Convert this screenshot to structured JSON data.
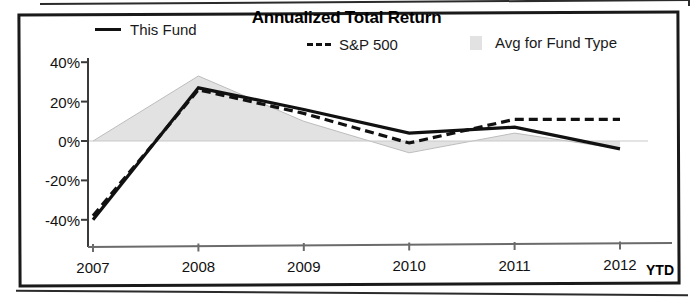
{
  "chart": {
    "title": "Annualized Total Return",
    "legend": [
      {
        "label": "This Fund",
        "marker": "solid-line-swatch"
      },
      {
        "label": "S&P 500",
        "marker": "dashed-line-swatch"
      },
      {
        "label": "Avg for Fund Type",
        "marker": "area-fill-swatch"
      }
    ],
    "ytd_suffix": "YTD"
  },
  "chart_data": {
    "type": "line",
    "title": "Annualized Total Return",
    "xlabel": "",
    "ylabel": "",
    "categories": [
      "2007",
      "2008",
      "2009",
      "2010",
      "2011",
      "2012"
    ],
    "x_tick_labels": [
      "2007",
      "2008",
      "2009",
      "2010",
      "2011",
      "2012"
    ],
    "y_tick_labels": [
      "40%",
      "20%",
      "0%",
      "-20%",
      "-40%"
    ],
    "y_ticks": [
      40,
      20,
      0,
      -20,
      -40
    ],
    "ylim": [
      -45,
      42
    ],
    "grid": false,
    "legend_position": "top",
    "series": [
      {
        "name": "This Fund",
        "style": "solid",
        "color": "#111111",
        "values": [
          -40,
          27,
          16,
          4,
          7,
          -4
        ]
      },
      {
        "name": "S&P 500",
        "style": "dashed",
        "color": "#111111",
        "values": [
          -38,
          26,
          14,
          -1,
          11,
          11
        ]
      },
      {
        "name": "Avg for Fund Type",
        "style": "area",
        "color": "#e2e2e2",
        "values": [
          0,
          33,
          10,
          -6,
          4,
          -4
        ]
      }
    ],
    "annotations": [
      "YTD"
    ]
  }
}
